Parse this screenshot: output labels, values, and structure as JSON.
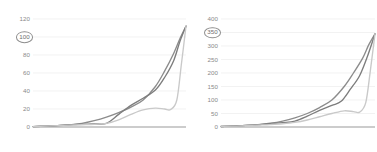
{
  "chart_data": [
    {
      "type": "line",
      "panel": "left",
      "title": "",
      "xlabel": "",
      "ylabel": "",
      "grid": true,
      "legend": "none",
      "ylim": [
        0,
        120
      ],
      "yticks": [
        0,
        20,
        40,
        60,
        80,
        100,
        120
      ],
      "ytick_labels": [
        "0",
        "20",
        "40",
        "60",
        "80",
        "100",
        "120"
      ],
      "highlighted_tick": "100",
      "xlim": [
        0,
        100
      ],
      "series": [
        {
          "name": "series-a",
          "color": "#8c8c8c",
          "x": [
            0,
            8,
            16,
            24,
            32,
            40,
            48,
            56,
            64,
            72,
            80,
            86,
            92,
            96,
            100
          ],
          "values": [
            0.5,
            1,
            1.5,
            2.5,
            4,
            7,
            11,
            16,
            22,
            30,
            45,
            62,
            82,
            98,
            112
          ]
        },
        {
          "name": "series-b",
          "color": "#7d7d7d",
          "x": [
            0,
            8,
            16,
            24,
            32,
            40,
            48,
            56,
            64,
            72,
            80,
            86,
            92,
            96,
            100
          ],
          "values": [
            0.5,
            1,
            1.5,
            2.5,
            3,
            3.5,
            4,
            14,
            24,
            32,
            41,
            55,
            74,
            95,
            112
          ]
        },
        {
          "name": "series-c",
          "color": "#c9c9c9",
          "x": [
            0,
            8,
            16,
            24,
            32,
            40,
            48,
            56,
            64,
            72,
            80,
            86,
            90,
            94,
            97,
            100
          ],
          "values": [
            0.5,
            1,
            1.5,
            2,
            2.5,
            3,
            4,
            8,
            14,
            19,
            21,
            20,
            19.5,
            30,
            70,
            112
          ]
        }
      ]
    },
    {
      "type": "line",
      "panel": "right",
      "title": "",
      "xlabel": "",
      "ylabel": "",
      "grid": true,
      "legend": "none",
      "ylim": [
        0,
        400
      ],
      "yticks": [
        0,
        50,
        100,
        150,
        200,
        250,
        300,
        350,
        400
      ],
      "ytick_labels": [
        "0",
        "50",
        "100",
        "150",
        "200",
        "250",
        "300",
        "350",
        "400"
      ],
      "highlighted_tick": "350",
      "xlim": [
        0,
        100
      ],
      "series": [
        {
          "name": "series-a",
          "color": "#8c8c8c",
          "x": [
            0,
            8,
            16,
            24,
            32,
            40,
            48,
            56,
            64,
            72,
            80,
            86,
            92,
            96,
            100
          ],
          "values": [
            2,
            4,
            6,
            9,
            14,
            22,
            34,
            50,
            72,
            100,
            150,
            200,
            255,
            305,
            345
          ]
        },
        {
          "name": "series-b",
          "color": "#7d7d7d",
          "x": [
            0,
            8,
            16,
            24,
            32,
            40,
            48,
            56,
            64,
            72,
            78,
            84,
            90,
            95,
            100
          ],
          "values": [
            2,
            4,
            6,
            9,
            12,
            16,
            22,
            40,
            62,
            80,
            95,
            140,
            190,
            260,
            345
          ]
        },
        {
          "name": "series-c",
          "color": "#c9c9c9",
          "x": [
            0,
            8,
            16,
            24,
            32,
            40,
            48,
            56,
            64,
            72,
            80,
            86,
            90,
            94,
            97,
            100
          ],
          "values": [
            2,
            3,
            5,
            7,
            9,
            12,
            17,
            26,
            38,
            50,
            60,
            57,
            55,
            90,
            210,
            345
          ]
        }
      ]
    }
  ]
}
